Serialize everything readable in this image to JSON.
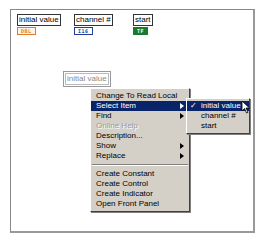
{
  "terminals": [
    {
      "label": "initial value",
      "type": "DBL",
      "color": "#e07a2c"
    },
    {
      "label": "channel #",
      "type": "I16",
      "color": "#1d3f9a"
    },
    {
      "label": "start",
      "type": "TF",
      "color": "#1b7a2c"
    }
  ],
  "local_variable": {
    "label": "initial value"
  },
  "context_menu": {
    "items": [
      {
        "label": "Change To Read Local"
      },
      {
        "label": "Select Item",
        "submenu": true,
        "selected": true
      },
      {
        "label": "Find",
        "submenu": true
      },
      {
        "label": "Online Help",
        "disabled": true
      },
      {
        "label": "Description..."
      },
      {
        "label": "Show",
        "submenu": true
      },
      {
        "label": "Replace",
        "submenu": true
      },
      {
        "label": "Create Constant"
      },
      {
        "label": "Create Control"
      },
      {
        "label": "Create Indicator"
      },
      {
        "label": "Open Front Panel"
      }
    ]
  },
  "submenu": {
    "check_glyph": "✓",
    "items": [
      {
        "label": "initial value",
        "checked": true
      },
      {
        "label": "channel #"
      },
      {
        "label": "start"
      }
    ]
  }
}
